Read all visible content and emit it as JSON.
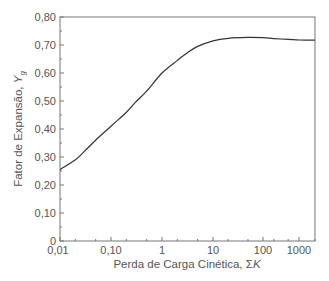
{
  "chart_data": {
    "type": "line",
    "title": "",
    "xlabel": "Perda de Carga Cinética, ΣK",
    "xlabel_main": "Perda de Carga Cinética, Σ",
    "xlabel_italic": "K",
    "ylabel": "Fator de Expansão, Y_g",
    "ylabel_main": "Fator de Expansão, ",
    "ylabel_italic": "Y",
    "ylabel_sub": "g",
    "xscale": "log",
    "xlim": [
      0.01,
      2000
    ],
    "ylim": [
      0,
      0.8
    ],
    "grid": false,
    "legend": null,
    "x_tick_labels": [
      "0,01",
      "0,10",
      "1",
      "10",
      "100",
      "1000"
    ],
    "y_tick_labels": [
      "0",
      "0,10",
      "0,20",
      "0,30",
      "0,40",
      "0,50",
      "0,60",
      "0,70",
      "0,80"
    ],
    "series": [
      {
        "name": "Y_g",
        "x": [
          0.01,
          0.02,
          0.03,
          0.05,
          0.1,
          0.2,
          0.3,
          0.5,
          1,
          2,
          3,
          5,
          10,
          20,
          50,
          100,
          200,
          500,
          1000,
          2000
        ],
        "values": [
          0.255,
          0.29,
          0.32,
          0.36,
          0.41,
          0.46,
          0.495,
          0.535,
          0.6,
          0.645,
          0.67,
          0.695,
          0.715,
          0.724,
          0.727,
          0.726,
          0.723,
          0.72,
          0.718,
          0.717
        ]
      }
    ]
  }
}
